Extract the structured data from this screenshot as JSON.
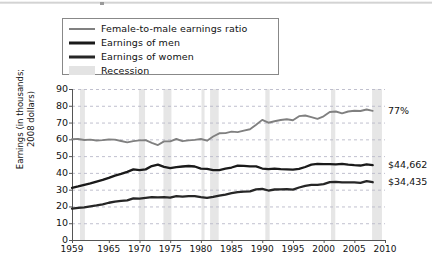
{
  "topbar": {
    "present": true
  },
  "legend": {
    "items": [
      {
        "label": "Female-to-male earnings ratio",
        "style": "thin-gray-line",
        "color": "#808080"
      },
      {
        "label": "Earnings of men",
        "style": "thick-black-line",
        "color": "#1a1a1a"
      },
      {
        "label": "Earnings of women",
        "style": "thick-black-line",
        "color": "#262626"
      },
      {
        "label": "Recession",
        "style": "gray-band",
        "color": "#e3e3e3"
      }
    ]
  },
  "annotations": {
    "ratio_end": "77%",
    "men_end": "$44,662",
    "women_end": "$34,435"
  },
  "chart_data": {
    "type": "line",
    "title": "",
    "xlabel": "",
    "ylabel": "Earnings (in thousands;\n2008 dollars)",
    "xlim": [
      1959,
      2010
    ],
    "ylim": [
      0,
      90
    ],
    "ytick_labels": [
      "0",
      "10",
      "20",
      "30",
      "40",
      "50",
      "60",
      "70",
      "80",
      "90"
    ],
    "ytick_values": [
      0,
      10,
      20,
      30,
      40,
      50,
      60,
      70,
      80,
      90
    ],
    "xtick_labels": [
      "1959",
      "1965",
      "1970",
      "1975",
      "1980",
      "1985",
      "1990",
      "1995",
      "2000",
      "2005",
      "2010"
    ],
    "xtick_values": [
      1959,
      1965,
      1970,
      1975,
      1980,
      1985,
      1990,
      1995,
      2000,
      2005,
      2010
    ],
    "grid": "horizontal-dashed",
    "legend_position": "top-left-outside",
    "x": [
      1959,
      1960,
      1961,
      1962,
      1963,
      1964,
      1965,
      1966,
      1967,
      1968,
      1969,
      1970,
      1971,
      1972,
      1973,
      1974,
      1975,
      1976,
      1977,
      1978,
      1979,
      1980,
      1981,
      1982,
      1983,
      1984,
      1985,
      1986,
      1987,
      1988,
      1989,
      1990,
      1991,
      1992,
      1993,
      1994,
      1995,
      1996,
      1997,
      1998,
      1999,
      2000,
      2001,
      2002,
      2003,
      2004,
      2005,
      2006,
      2007,
      2008
    ],
    "series": [
      {
        "name": "Female-to-male earnings ratio",
        "unit": "percent",
        "axis": "left-scaled",
        "color": "#808080",
        "values": [
          60.1,
          60.2,
          59.6,
          59.8,
          59.3,
          59.5,
          59.9,
          59.8,
          59.0,
          58.2,
          58.9,
          59.4,
          59.5,
          57.9,
          56.6,
          58.8,
          58.8,
          60.2,
          58.9,
          59.4,
          59.7,
          60.2,
          59.2,
          61.7,
          63.6,
          63.7,
          64.6,
          64.3,
          65.2,
          66.0,
          68.7,
          71.6,
          69.9,
          70.8,
          71.5,
          72.0,
          71.4,
          73.8,
          74.2,
          73.2,
          72.2,
          73.7,
          76.3,
          76.6,
          75.5,
          76.6,
          77.0,
          76.9,
          77.8,
          77.0
        ]
      },
      {
        "name": "Earnings of men",
        "unit": "thousands of 2008 dollars",
        "color": "#1a1a1a",
        "values": [
          31.1,
          31.9,
          32.8,
          33.7,
          34.8,
          35.8,
          37.0,
          38.4,
          39.4,
          40.6,
          42.1,
          41.6,
          42.1,
          44.1,
          44.9,
          43.6,
          42.8,
          43.4,
          43.8,
          44.1,
          43.8,
          42.5,
          42.4,
          41.7,
          41.7,
          42.6,
          43.2,
          44.3,
          44.2,
          43.9,
          43.9,
          42.6,
          42.2,
          42.5,
          42.2,
          42.1,
          42.0,
          42.4,
          43.5,
          44.9,
          45.4,
          45.2,
          45.2,
          45.1,
          45.4,
          44.9,
          44.6,
          44.4,
          45.1,
          44.662
        ]
      },
      {
        "name": "Earnings of women",
        "unit": "thousands of 2008 dollars",
        "color": "#262626",
        "values": [
          18.7,
          19.2,
          19.5,
          20.1,
          20.6,
          21.3,
          22.2,
          22.9,
          23.3,
          23.6,
          24.8,
          24.7,
          25.1,
          25.5,
          25.4,
          25.6,
          25.2,
          26.1,
          25.8,
          26.2,
          26.2,
          25.6,
          25.1,
          25.7,
          26.5,
          27.1,
          27.9,
          28.5,
          28.8,
          29.0,
          30.2,
          30.5,
          29.5,
          30.1,
          30.2,
          30.3,
          30.0,
          31.3,
          32.3,
          32.9,
          32.8,
          33.3,
          34.5,
          34.6,
          34.3,
          34.4,
          34.3,
          34.1,
          35.1,
          34.435
        ]
      }
    ],
    "recessions": [
      {
        "start": 1960.3,
        "end": 1961.1
      },
      {
        "start": 1969.9,
        "end": 1970.9
      },
      {
        "start": 1973.9,
        "end": 1975.2
      },
      {
        "start": 1980.1,
        "end": 1980.6
      },
      {
        "start": 1981.5,
        "end": 1982.9
      },
      {
        "start": 1990.5,
        "end": 1991.2
      },
      {
        "start": 2001.2,
        "end": 2001.9
      },
      {
        "start": 2007.9,
        "end": 2009.5
      }
    ]
  }
}
